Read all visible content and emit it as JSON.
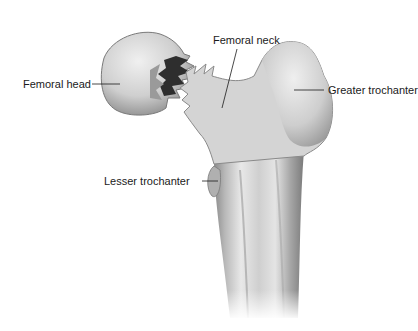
{
  "figure": {
    "labels": {
      "femoral_head": "Femoral head",
      "femoral_neck": "Femoral neck",
      "greater_trochanter": "Greater trochanter",
      "lesser_trochanter": "Lesser trochanter"
    },
    "colors": {
      "background": "#ffffff",
      "bone_light": "#e6e6e6",
      "bone_mid": "#bdbdbd",
      "bone_dark": "#6e6e6e",
      "fracture_dark": "#2e2e2e",
      "leader_line": "#1a1a1a"
    }
  }
}
